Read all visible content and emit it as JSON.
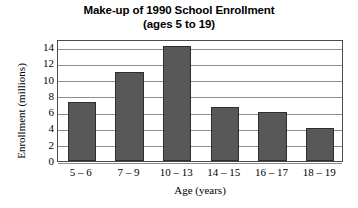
{
  "chart_data": {
    "type": "bar",
    "title": "Make-up of 1990 School Enrollment",
    "subtitle": "(ages 5 to 19)",
    "xlabel": "Age (years)",
    "ylabel": "Enrollment (millions)",
    "categories": [
      "5 – 6",
      "7 – 9",
      "10 – 13",
      "14 – 15",
      "16 – 17",
      "18 – 19"
    ],
    "values": [
      7.3,
      11.0,
      14.1,
      6.6,
      6.0,
      4.0
    ],
    "ylim": [
      0,
      15
    ],
    "yticks": [
      0,
      2,
      4,
      6,
      8,
      10,
      12,
      14
    ],
    "ytick_labels": [
      "0",
      "2",
      "4",
      "6",
      "8",
      "10",
      "12",
      "14"
    ],
    "grid": true,
    "legend": false,
    "bar_color": "#585858",
    "bar_edge_color": "#2e2e2e",
    "grid_color": "#8d8d8d",
    "frame_color": "#4a4a4a",
    "background": "#ffffff"
  }
}
